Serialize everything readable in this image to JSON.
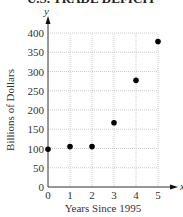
{
  "chart_data": {
    "type": "scatter",
    "title": "U.S. TRADE DEFICIT",
    "xlabel": "Years Since 1995",
    "ylabel": "Billions of Dollars",
    "x_axis_letter": "x",
    "y_axis_letter": "y",
    "x": [
      0,
      1,
      2,
      3,
      4,
      5
    ],
    "values": [
      98,
      105,
      105,
      167,
      277,
      378
    ],
    "xlim": [
      0,
      5
    ],
    "ylim": [
      0,
      400
    ],
    "x_ticks": [
      "0",
      "1",
      "2",
      "3",
      "4",
      "5"
    ],
    "y_ticks": [
      "0",
      "50",
      "100",
      "150",
      "200",
      "250",
      "300",
      "350",
      "400"
    ],
    "grid": true,
    "legend": null,
    "point_color": "#000000"
  }
}
